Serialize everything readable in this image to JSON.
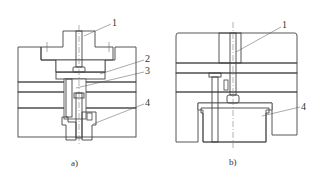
{
  "figure": {
    "type": "engineering cross-section drawing",
    "subfigures": [
      {
        "id": "a",
        "caption": "a)",
        "callouts": [
          {
            "number": "1",
            "target": "central pin / rod through top boss"
          },
          {
            "number": "2",
            "target": "intermediate plate"
          },
          {
            "number": "3",
            "target": "push rod / pin"
          },
          {
            "number": "4",
            "target": "bottom bushing / sleeve"
          }
        ]
      },
      {
        "id": "b",
        "caption": "b)",
        "callouts": [
          {
            "number": "1",
            "target": "central pin / rod"
          },
          {
            "number": "4",
            "target": "bottom block / insert"
          }
        ]
      }
    ]
  },
  "labels": {
    "a_1": "1",
    "a_2": "2",
    "a_3": "3",
    "a_4": "4",
    "a_caption": "a)",
    "b_1": "1",
    "b_4": "4",
    "b_caption": "b)"
  },
  "colors": {
    "line": "#444444",
    "hatch": "#666666",
    "background": "#ffffff"
  }
}
